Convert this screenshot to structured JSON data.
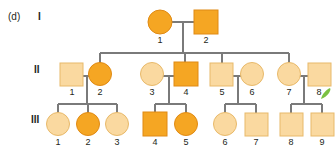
{
  "figure": {
    "panel_label": "(d)",
    "type": "pedigree-chart",
    "colors": {
      "affected_fill": "#F5A623",
      "affected_stroke": "#E08A14",
      "unaffected_fill": "#FAD9A0",
      "unaffected_stroke": "#E8B96A",
      "line": "#7a7a7a",
      "text": "#231f20",
      "arrow": "#7AC143"
    }
  },
  "generations": [
    {
      "label": "I",
      "individuals": [
        {
          "id": "I-1",
          "number": "1",
          "sex": "female",
          "shape": "circle",
          "status": "affected",
          "x": 160,
          "y": 22
        },
        {
          "id": "I-2",
          "number": "2",
          "sex": "male",
          "shape": "square",
          "status": "affected",
          "x": 206,
          "y": 22
        }
      ]
    },
    {
      "label": "II",
      "individuals": [
        {
          "id": "II-1",
          "number": "1",
          "sex": "male",
          "shape": "square",
          "status": "unaffected",
          "x": 72,
          "y": 74
        },
        {
          "id": "II-2",
          "number": "2",
          "sex": "female",
          "shape": "circle",
          "status": "affected",
          "x": 100,
          "y": 74
        },
        {
          "id": "II-3",
          "number": "3",
          "sex": "female",
          "shape": "circle",
          "status": "unaffected",
          "x": 152,
          "y": 74
        },
        {
          "id": "II-4",
          "number": "4",
          "sex": "male",
          "shape": "square",
          "status": "affected",
          "x": 185,
          "y": 74
        },
        {
          "id": "II-5",
          "number": "5",
          "sex": "male",
          "shape": "square",
          "status": "unaffected",
          "x": 222,
          "y": 74
        },
        {
          "id": "II-6",
          "number": "6",
          "sex": "female",
          "shape": "circle",
          "status": "unaffected",
          "x": 252,
          "y": 74
        },
        {
          "id": "II-7",
          "number": "7",
          "sex": "female",
          "shape": "circle",
          "status": "unaffected",
          "x": 289,
          "y": 74
        },
        {
          "id": "II-8",
          "number": "8",
          "sex": "male",
          "shape": "square",
          "status": "unaffected",
          "x": 319,
          "y": 74
        }
      ]
    },
    {
      "label": "III",
      "individuals": [
        {
          "id": "III-1",
          "number": "1",
          "sex": "female",
          "shape": "circle",
          "status": "unaffected",
          "x": 58,
          "y": 124
        },
        {
          "id": "III-2",
          "number": "2",
          "sex": "female",
          "shape": "circle",
          "status": "affected",
          "x": 88,
          "y": 124
        },
        {
          "id": "III-3",
          "number": "3",
          "sex": "female",
          "shape": "circle",
          "status": "unaffected",
          "x": 117,
          "y": 124
        },
        {
          "id": "III-4",
          "number": "4",
          "sex": "male",
          "shape": "square",
          "status": "affected",
          "x": 155,
          "y": 124
        },
        {
          "id": "III-5",
          "number": "5",
          "sex": "female",
          "shape": "circle",
          "status": "affected",
          "x": 186,
          "y": 124
        },
        {
          "id": "III-6",
          "number": "6",
          "sex": "female",
          "shape": "circle",
          "status": "unaffected",
          "x": 225,
          "y": 124
        },
        {
          "id": "III-7",
          "number": "7",
          "sex": "male",
          "shape": "square",
          "status": "unaffected",
          "x": 256,
          "y": 124
        },
        {
          "id": "III-8",
          "number": "8",
          "sex": "male",
          "shape": "square",
          "status": "unaffected",
          "x": 291,
          "y": 124
        },
        {
          "id": "III-9",
          "number": "9",
          "sex": "male",
          "shape": "square",
          "status": "unaffected",
          "x": 322,
          "y": 124
        }
      ]
    }
  ],
  "annotations": {
    "proband_arrow": {
      "points_to": "II-8",
      "color": "#7AC143",
      "x": 325,
      "y": 94
    }
  },
  "generation_labels": [
    {
      "text": "I",
      "x": 40,
      "y": 17
    },
    {
      "text": "II",
      "x": 36,
      "y": 69
    },
    {
      "text": "III",
      "x": 33,
      "y": 119
    }
  ]
}
